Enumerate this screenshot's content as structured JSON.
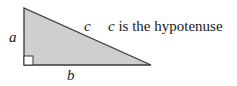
{
  "diagram": {
    "type": "right-triangle",
    "fill_color": "#cfcfcf",
    "stroke_color": "#333333",
    "labels": {
      "leg_vertical": "a",
      "leg_horizontal": "b",
      "hypotenuse": "c"
    },
    "caption": {
      "variable": "c",
      "text": " is the hypotenuse"
    },
    "right_angle_marker": true
  }
}
